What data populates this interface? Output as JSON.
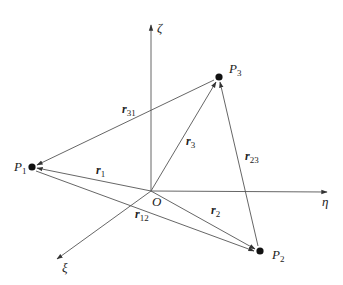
{
  "diagram": {
    "type": "three-body position vectors",
    "origin": {
      "label": "O",
      "x": 151,
      "y": 191
    },
    "axes": [
      {
        "name": "zeta-axis",
        "label": "ζ",
        "end": [
          151,
          25
        ]
      },
      {
        "name": "eta-axis",
        "label": "η",
        "end": [
          327,
          192
        ]
      },
      {
        "name": "xi-axis",
        "label": "ξ",
        "end": [
          57,
          259
        ]
      }
    ],
    "points": [
      {
        "name": "P1",
        "label": "P",
        "sub": "1",
        "x": 32,
        "y": 167
      },
      {
        "name": "P2",
        "label": "P",
        "sub": "2",
        "x": 260,
        "y": 251
      },
      {
        "name": "P3",
        "label": "P",
        "sub": "3",
        "x": 219,
        "y": 77
      }
    ],
    "vectors": [
      {
        "name": "r1",
        "label": "r",
        "sub": "1",
        "from": "O",
        "to": "P1"
      },
      {
        "name": "r2",
        "label": "r",
        "sub": "2",
        "from": "O",
        "to": "P2"
      },
      {
        "name": "r3",
        "label": "r",
        "sub": "3",
        "from": "O",
        "to": "P3"
      },
      {
        "name": "r12",
        "label": "r",
        "sub": "12",
        "from": "P1",
        "to": "P2"
      },
      {
        "name": "r23",
        "label": "r",
        "sub": "23",
        "from": "P2",
        "to": "P3"
      },
      {
        "name": "r31",
        "label": "r",
        "sub": "31",
        "from": "P3",
        "to": "P1"
      }
    ]
  },
  "labels": {
    "origin": "O",
    "zeta": "ζ",
    "eta": "η",
    "xi": "ξ",
    "p": "P",
    "p1_sub": "1",
    "p2_sub": "2",
    "p3_sub": "3",
    "r": "r",
    "r1_sub": "1",
    "r2_sub": "2",
    "r3_sub": "3",
    "r12_sub": "12",
    "r23_sub": "23",
    "r31_sub": "31"
  }
}
